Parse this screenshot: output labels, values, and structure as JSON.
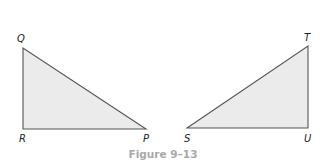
{
  "figure": {
    "caption": "Figure 9–13",
    "colors": {
      "fill": "#ebebeb",
      "stroke": "#555555",
      "caption": "#a9a9a9",
      "label": "#222222"
    },
    "triangles": [
      {
        "name": "QRP",
        "vertices": [
          {
            "label": "Q",
            "x": 23,
            "y": 48
          },
          {
            "label": "R",
            "x": 23,
            "y": 129
          },
          {
            "label": "P",
            "x": 146,
            "y": 129
          }
        ],
        "right_angle_at": "R"
      },
      {
        "name": "STU",
        "vertices": [
          {
            "label": "S",
            "x": 187,
            "y": 128
          },
          {
            "label": "T",
            "x": 308,
            "y": 46
          },
          {
            "label": "U",
            "x": 308,
            "y": 128
          }
        ],
        "right_angle_at": "U"
      }
    ],
    "labels": {
      "Q": "Q",
      "R": "R",
      "P": "P",
      "S": "S",
      "T": "T",
      "U": "U"
    }
  }
}
